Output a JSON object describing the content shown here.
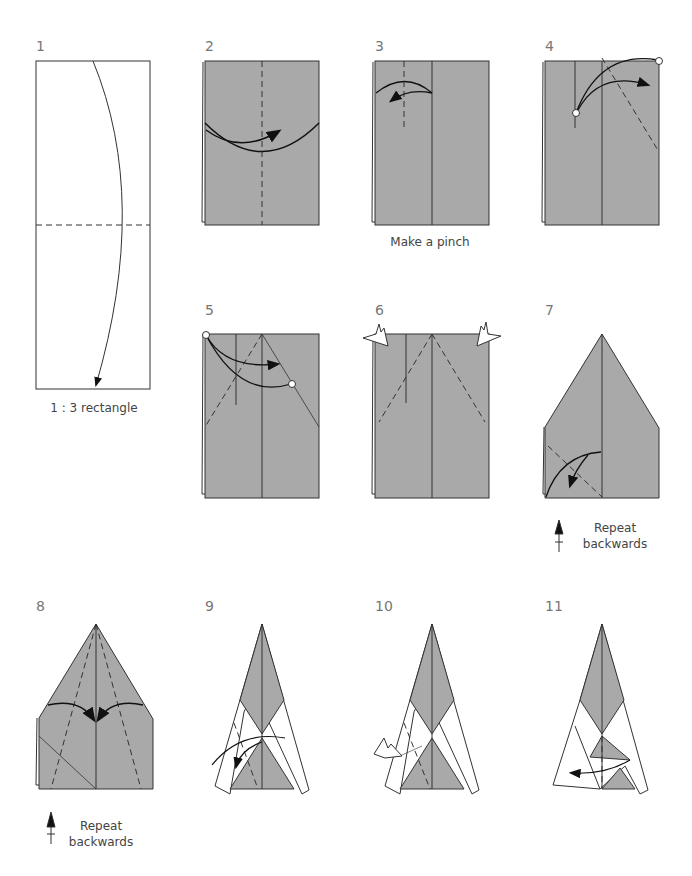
{
  "steps": [
    {
      "number": "1",
      "caption": "1 : 3 rectangle"
    },
    {
      "number": "2",
      "caption": ""
    },
    {
      "number": "3",
      "caption": "Make a pinch"
    },
    {
      "number": "4",
      "caption": ""
    },
    {
      "number": "5",
      "caption": ""
    },
    {
      "number": "6",
      "caption": ""
    },
    {
      "number": "7",
      "caption_line1": "Repeat",
      "caption_line2": "backwards"
    },
    {
      "number": "8",
      "caption_line1": "Repeat",
      "caption_line2": "backwards"
    },
    {
      "number": "9",
      "caption": ""
    },
    {
      "number": "10",
      "caption": ""
    },
    {
      "number": "11",
      "caption": ""
    }
  ],
  "colors": {
    "paper_gray": "#a9a9a9",
    "line": "#333333",
    "label": "#777777"
  }
}
